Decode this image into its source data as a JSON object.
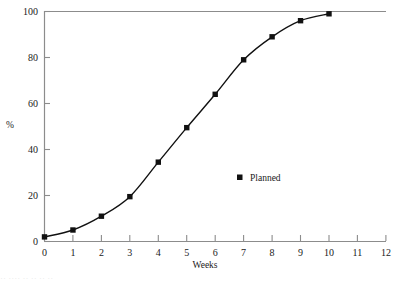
{
  "chart_data": {
    "type": "line",
    "title": "",
    "subtitle": "",
    "xlabel": "Weeks",
    "ylabel": "%",
    "xlim": [
      0,
      12
    ],
    "ylim": [
      0,
      100
    ],
    "xticks": [
      0,
      1,
      2,
      3,
      4,
      5,
      6,
      7,
      8,
      9,
      10,
      11,
      12
    ],
    "xtick_labels": [
      "0",
      "1",
      "2",
      "3",
      "4",
      "5",
      "6",
      "7",
      "8",
      "9",
      "10",
      "11",
      "12"
    ],
    "yticks": [
      0,
      20,
      40,
      60,
      80,
      100
    ],
    "ytick_labels": [
      "0",
      "20",
      "40",
      "60",
      "80",
      "100"
    ],
    "grid": false,
    "legend_position": "center-right-inside",
    "series": [
      {
        "name": "Planned",
        "marker": "filled-square",
        "color": "#111111",
        "x": [
          0,
          1,
          2,
          3,
          4,
          5,
          6,
          7,
          8,
          9,
          10
        ],
        "values": [
          2,
          5,
          11,
          19.5,
          34.5,
          49.5,
          64,
          79,
          89,
          96,
          99
        ]
      }
    ],
    "annotations": []
  },
  "legend": {
    "entries": [
      {
        "label": "Planned",
        "marker": "filled-square",
        "color": "#111111"
      }
    ]
  },
  "axes": {
    "x_axis_label": "Weeks",
    "y_axis_label": "%",
    "x_tick_labels": [
      "0",
      "1",
      "2",
      "3",
      "4",
      "5",
      "6",
      "7",
      "8",
      "9",
      "10",
      "11",
      "12"
    ],
    "y_tick_labels": [
      "0",
      "20",
      "40",
      "60",
      "80",
      "100"
    ]
  },
  "colors": {
    "axis": "#8c8c8c",
    "curve": "#111111",
    "marker": "#111111",
    "text": "#1a1a1a",
    "background": "#ffffff"
  },
  "footer_artifact": "··    ····  ··        ··     ··      ··"
}
